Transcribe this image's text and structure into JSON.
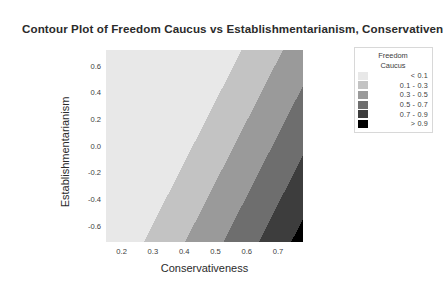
{
  "chart_data": {
    "type": "contour",
    "title": "Contour Plot of Freedom Caucus vs Establishmentarianism, Conservativen",
    "xlabel": "Conservativeness",
    "ylabel": "Establishmentarianism",
    "xlim": [
      0.15,
      0.78
    ],
    "ylim": [
      -0.72,
      0.72
    ],
    "xticks": [
      "0.2",
      "0.3",
      "0.4",
      "0.5",
      "0.6",
      "0.7"
    ],
    "xtick_values": [
      0.2,
      0.3,
      0.4,
      0.5,
      0.6,
      0.7
    ],
    "yticks": [
      "0.6",
      "0.4",
      "0.2",
      "0.0",
      "-0.2",
      "-0.4",
      "-0.6"
    ],
    "ytick_values": [
      0.6,
      0.4,
      0.2,
      0.0,
      -0.2,
      -0.4,
      -0.6
    ],
    "zvar": "Freedom Caucus",
    "grid": false,
    "legend_position": "right",
    "levels": [
      0.1,
      0.3,
      0.5,
      0.7,
      0.9
    ],
    "bands": [
      {
        "label": "< 0.1",
        "color": "#e8e8e8",
        "zmin": null,
        "zmax": 0.1
      },
      {
        "label": "0.1  -  0.3",
        "color": "#c3c3c3",
        "zmin": 0.1,
        "zmax": 0.3
      },
      {
        "label": "0.3  -  0.5",
        "color": "#9a9a9a",
        "zmin": 0.3,
        "zmax": 0.5
      },
      {
        "label": "0.5  -  0.7",
        "color": "#6e6e6e",
        "zmin": 0.5,
        "zmax": 0.7
      },
      {
        "label": "0.7  -  0.9",
        "color": "#3d3d3d",
        "zmin": 0.7,
        "zmax": 0.9
      },
      {
        "label": "> 0.9",
        "color": "#000000",
        "zmin": 0.9,
        "zmax": null
      }
    ],
    "band_direction": "value increases toward lower-right along diagonal"
  },
  "legend": {
    "title_line1": "Freedom",
    "title_line2": "Caucus"
  },
  "colors": {
    "background": "#ffffff",
    "text": "#2b2b2b",
    "tick_text": "#3c3c3c",
    "legend_border": "#d8d8d8"
  }
}
